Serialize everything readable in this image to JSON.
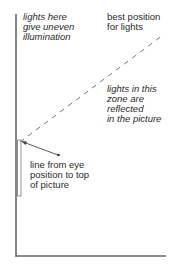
{
  "labels": {
    "uneven": "lights here\ngive uneven\nillumination",
    "best": "best position\nfor lights",
    "reflected": "lights in this\nzone are\nreflected\nin the picture",
    "eye_line": "line from eye\nposition to top\nof picture"
  },
  "colors": {
    "line": "#555555",
    "dash": "#777777",
    "text": "#2a2a2a"
  }
}
